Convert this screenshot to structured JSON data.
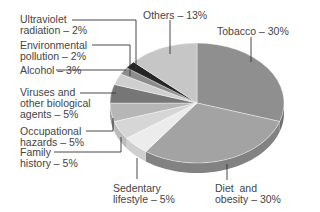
{
  "chart_data": {
    "type": "pie",
    "style": "3d-tilted",
    "title": "",
    "start_angle_deg": 0,
    "direction": "clockwise",
    "slices": [
      {
        "label": "Tobacco",
        "value": 30,
        "text": "Tobacco – 30%",
        "color": "#8f8f8f",
        "side": "#6f6f6f"
      },
      {
        "label": "Diet and obesity",
        "value": 30,
        "text": "Diet  and\nobesity – 30%",
        "color": "#a3a3a3",
        "side": "#828282"
      },
      {
        "label": "Sedentary lifestyle",
        "value": 5,
        "text": "Sedentary\nlifestyle – 5%",
        "color": "#ececec",
        "side": "#cfcfcf"
      },
      {
        "label": "Family history",
        "value": 5,
        "text": "Family\nhistory – 5%",
        "color": "#d6d6d6",
        "side": "#bcbcbc"
      },
      {
        "label": "Occupational hazards",
        "value": 5,
        "text": "Occupational\nhazards – 5%",
        "color": "#b6b6b6",
        "side": "#9a9a9a"
      },
      {
        "label": "Viruses and other biological agents",
        "value": 5,
        "text": "Viruses and\nother biological\nagents – 5%",
        "color": "#767676",
        "side": "#5a5a5a"
      },
      {
        "label": "Alcohol",
        "value": 3,
        "text": "Alcohol – 3%",
        "color": "#cfcfcf",
        "side": "#b0b0b0"
      },
      {
        "label": "Environmental pollution",
        "value": 2,
        "text": "Environmental\npollution – 2%",
        "color": "#8c8c8c",
        "side": "#6c6c6c"
      },
      {
        "label": "Ultraviolet radiation",
        "value": 2,
        "text": "Ultraviolet\nradiation – 2%",
        "color": "#262626",
        "side": "#111111"
      },
      {
        "label": "Others",
        "value": 13,
        "text": "Others – 13%",
        "color": "#c6c6c6",
        "side": "#a8a8a8"
      }
    ],
    "legend": "none (leader-line labels)"
  },
  "labels": {
    "tobacco": "Tobacco – 30%",
    "diet": "Diet  and\nobesity – 30%",
    "sedentary": "Sedentary\nlifestyle – 5%",
    "family": "Family\nhistory – 5%",
    "occupational": "Occupational\nhazards – 5%",
    "viruses": "Viruses and\nother biological\nagents – 5%",
    "alcohol": "Alcohol – 3%",
    "environmental": "Environmental\npollution – 2%",
    "uv": "Ultraviolet\nradiation – 2%",
    "others": "Others – 13%"
  }
}
